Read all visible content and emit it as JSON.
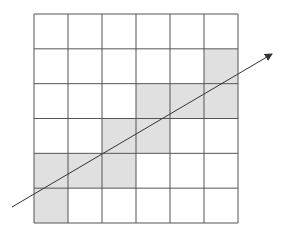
{
  "diagram": {
    "grid": {
      "rows": 6,
      "cols": 6,
      "x0": 34,
      "y0": 14,
      "x1": 238,
      "y1": 223,
      "line_color": "#555555",
      "cell_fill": "#ffffff",
      "shaded_fill": "#e0e0e0",
      "shaded_cells": [
        [
          1,
          5
        ],
        [
          2,
          3
        ],
        [
          2,
          4
        ],
        [
          2,
          5
        ],
        [
          3,
          2
        ],
        [
          3,
          3
        ],
        [
          4,
          0
        ],
        [
          4,
          1
        ],
        [
          4,
          2
        ],
        [
          5,
          0
        ]
      ]
    },
    "arrow": {
      "x1": 12,
      "y1": 207,
      "x2": 272,
      "y2": 54,
      "color": "#333333"
    }
  }
}
